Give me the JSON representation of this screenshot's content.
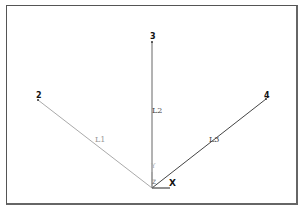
{
  "diagram": {
    "nodes": [
      {
        "id": "1",
        "label": "1",
        "x": 152,
        "y": 188
      },
      {
        "id": "2",
        "label": "2",
        "x": 38,
        "y": 100
      },
      {
        "id": "3",
        "label": "3",
        "x": 152,
        "y": 42
      },
      {
        "id": "4",
        "label": "4",
        "x": 266,
        "y": 99
      }
    ],
    "lines": [
      {
        "id": "L1",
        "label": "L1",
        "from": "1",
        "to": "2",
        "color": "#aaaaaa"
      },
      {
        "id": "L2",
        "label": "L2",
        "from": "1",
        "to": "3",
        "color": "#666666"
      },
      {
        "id": "L3",
        "label": "L3",
        "from": "1",
        "to": "4",
        "color": "#444444"
      }
    ],
    "axes": {
      "x_label": "X",
      "y_label": "Y",
      "origin_label": "Z"
    }
  }
}
